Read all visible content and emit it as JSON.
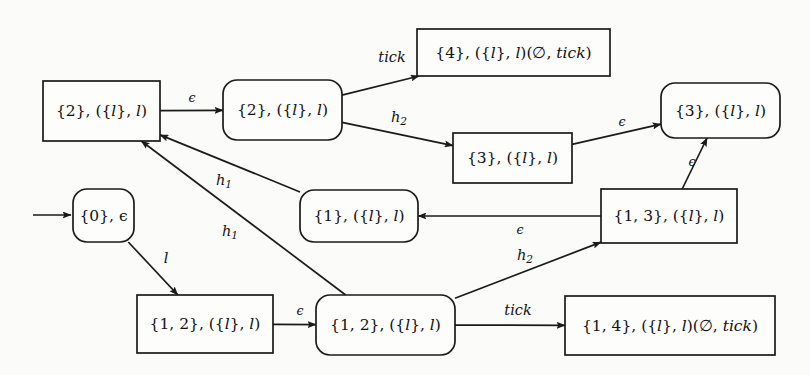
{
  "diagram": {
    "background_color": "#fbfbf9",
    "stroke_color": "#1b1b1b",
    "node_fill": "#fdfdfb",
    "nodes": [
      {
        "id": "n0",
        "label": "{0}, ϵ",
        "shape": "rounded",
        "x": 73,
        "y": 189,
        "w": 61,
        "h": 53
      },
      {
        "id": "n2r",
        "label": "{2}, ({l}, l)",
        "shape": "rectangle",
        "x": 43,
        "y": 81,
        "w": 117,
        "h": 60
      },
      {
        "id": "n2d",
        "label": "{2}, ({l}, l)",
        "shape": "rounded",
        "x": 223,
        "y": 80,
        "w": 119,
        "h": 60
      },
      {
        "id": "n4",
        "label": "{4}, ({l}, l)(∅, tick)",
        "shape": "rectangle",
        "x": 417,
        "y": 29,
        "w": 193,
        "h": 47
      },
      {
        "id": "n3r",
        "label": "{3}, ({l}, l)",
        "shape": "rectangle",
        "x": 453,
        "y": 133,
        "w": 119,
        "h": 50
      },
      {
        "id": "n3d",
        "label": "{3}, ({l}, l)",
        "shape": "rounded",
        "x": 661,
        "y": 83,
        "w": 119,
        "h": 55
      },
      {
        "id": "n1",
        "label": "{1}, ({l}, l)",
        "shape": "rounded",
        "x": 300,
        "y": 190,
        "w": 118,
        "h": 52
      },
      {
        "id": "n13",
        "label": "{1, 3}, ({l}, l)",
        "shape": "rectangle",
        "x": 601,
        "y": 189,
        "w": 136,
        "h": 54
      },
      {
        "id": "n12r",
        "label": "{1, 2}, ({l}, l)",
        "shape": "rectangle",
        "x": 137,
        "y": 295,
        "w": 136,
        "h": 58
      },
      {
        "id": "n12d",
        "label": "{1, 2}, ({l}, l)",
        "shape": "rounded",
        "x": 316,
        "y": 295,
        "w": 139,
        "h": 60
      },
      {
        "id": "n14",
        "label": "{1, 4}, ({l}, l)(∅, tick)",
        "shape": "rectangle",
        "x": 565,
        "y": 296,
        "w": 210,
        "h": 59
      }
    ],
    "start_arrow": {
      "name": "initial-state-arrow",
      "from_x": 33,
      "to_x": 71,
      "y": 215
    },
    "edges": [
      {
        "id": "e1",
        "label": "ϵ",
        "from": "n2r",
        "to": "n2d",
        "label_x": 192,
        "label_y": 98,
        "style": "plain"
      },
      {
        "id": "e2",
        "label": "tick",
        "from": "n2d",
        "to": "n4",
        "label_x": 392,
        "label_y": 58,
        "style": "plain"
      },
      {
        "id": "e3",
        "label": "h",
        "sub": "2",
        "from": "n2d",
        "to": "n3r",
        "label_x": 399,
        "label_y": 118,
        "style": "sub"
      },
      {
        "id": "e4",
        "label": "ϵ",
        "from": "n3r",
        "to": "n3d",
        "label_x": 622,
        "label_y": 122,
        "style": "plain"
      },
      {
        "id": "e5",
        "label": "ϵ",
        "from": "n13",
        "to": "n3d",
        "label_x": 692,
        "label_y": 162,
        "style": "plain"
      },
      {
        "id": "e6",
        "label": "ϵ",
        "from": "n13",
        "to": "n1",
        "label_x": 520,
        "label_y": 230,
        "style": "plain"
      },
      {
        "id": "e7",
        "label": "h",
        "sub": "1",
        "from": "n1",
        "to": "n2r",
        "label_x": 224,
        "label_y": 181,
        "style": "sub"
      },
      {
        "id": "e8",
        "label": "h",
        "sub": "1",
        "from": "n12d",
        "to": "n2r",
        "label_x": 230,
        "label_y": 232,
        "style": "sub"
      },
      {
        "id": "e9",
        "label": "l",
        "from": "n0",
        "to": "n12r",
        "label_x": 166,
        "label_y": 259,
        "style": "plain"
      },
      {
        "id": "e10",
        "label": "ϵ",
        "from": "n12r",
        "to": "n12d",
        "label_x": 300,
        "label_y": 311,
        "style": "plain"
      },
      {
        "id": "e11",
        "label": "tick",
        "from": "n12d",
        "to": "n14",
        "label_x": 518,
        "label_y": 311,
        "style": "plain"
      },
      {
        "id": "e12",
        "label": "h",
        "sub": "2",
        "from": "n12d",
        "to": "n13",
        "label_x": 525,
        "label_y": 256,
        "style": "sub"
      }
    ]
  }
}
